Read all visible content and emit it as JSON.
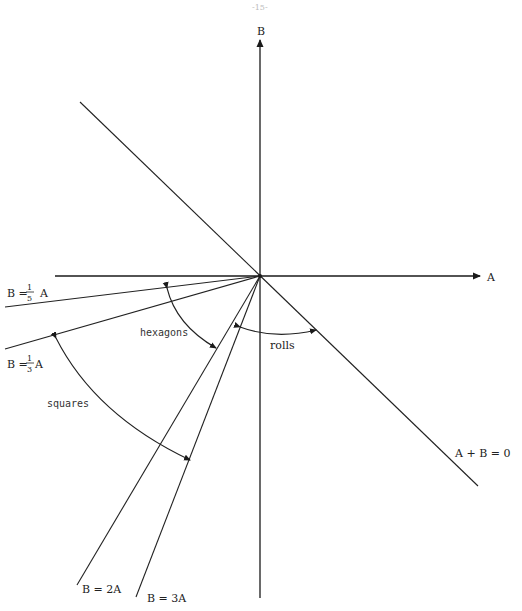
{
  "page": {
    "number": "-15-"
  },
  "axes": {
    "horizontal": {
      "label": "A"
    },
    "vertical": {
      "label": "B"
    }
  },
  "lines": [
    {
      "id": "a-plus-b-zero",
      "label": "A + B = 0"
    },
    {
      "id": "b-fifth-a",
      "label_prefix": "B =",
      "frac_num": "1",
      "frac_den": "5",
      "label_suffix": "A"
    },
    {
      "id": "b-third-a",
      "label_prefix": "B =",
      "frac_num": "1",
      "frac_den": "3",
      "label_suffix": "A"
    },
    {
      "id": "b-2a",
      "label": "B = 2A"
    },
    {
      "id": "b-3a",
      "label": "B = 3A"
    }
  ],
  "regions": {
    "hexagons": "hexagons",
    "squares": "squares",
    "rolls": "rolls"
  },
  "colors": {
    "ink": "#222222",
    "background": "#ffffff"
  }
}
